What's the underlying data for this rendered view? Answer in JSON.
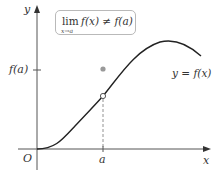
{
  "figure": {
    "annotation_box": {
      "lim": "lim",
      "subscript": "x→a",
      "expression": "f(x) ≠ f(a)"
    },
    "labels": {
      "y_axis": "y",
      "x_axis": "x",
      "origin": "O",
      "a_tick": "a",
      "fa_tick": "f(a)",
      "curve": "y = f(x)"
    },
    "points": {
      "filled_point": "(a, f(a))",
      "open_point": "limit value at x = a"
    },
    "colors": {
      "axis": "#555555",
      "curve": "#222222",
      "filled_dot": "#999999",
      "dashed": "#777777",
      "box_border": "#b9b9b9"
    }
  }
}
